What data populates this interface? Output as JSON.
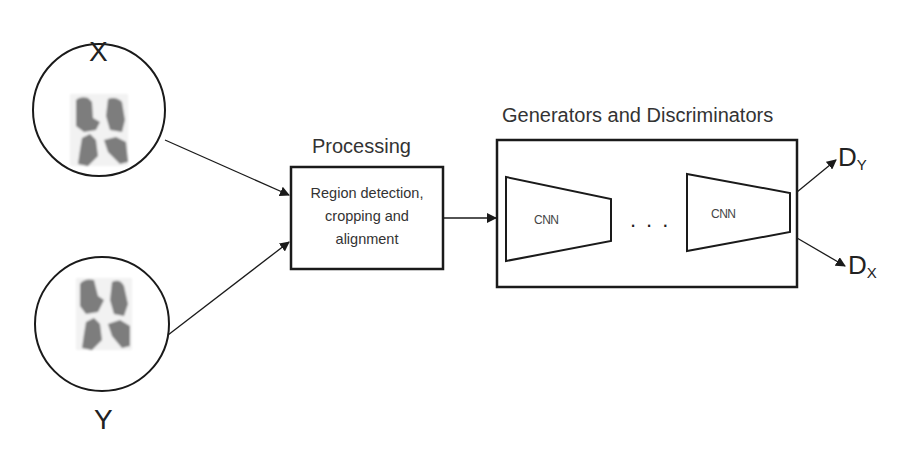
{
  "diagram": {
    "inputs": [
      {
        "id": "x",
        "label": "X",
        "image": "lung-scan-thumbnail"
      },
      {
        "id": "y",
        "label": "Y",
        "image": "lung-scan-thumbnail"
      }
    ],
    "processing": {
      "title": "Processing",
      "lines": [
        "Region detection,",
        "cropping and",
        "alignment"
      ]
    },
    "gan_block": {
      "title": "Generators and Discriminators",
      "networks": [
        {
          "label": "CNN"
        },
        {
          "label": "CNN"
        }
      ],
      "ellipsis": "..."
    },
    "outputs": [
      {
        "id": "dy",
        "main": "D",
        "sub": "Y"
      },
      {
        "id": "dx",
        "main": "D",
        "sub": "X"
      }
    ],
    "edges": [
      {
        "from": "x",
        "to": "processing"
      },
      {
        "from": "y",
        "to": "processing"
      },
      {
        "from": "processing",
        "to": "gan_block"
      },
      {
        "from": "gan_block",
        "to": "dy"
      },
      {
        "from": "gan_block",
        "to": "dx"
      }
    ],
    "colors": {
      "stroke": "#1a1a1a",
      "lung": "#7a7a7a",
      "background": "#ffffff"
    }
  }
}
